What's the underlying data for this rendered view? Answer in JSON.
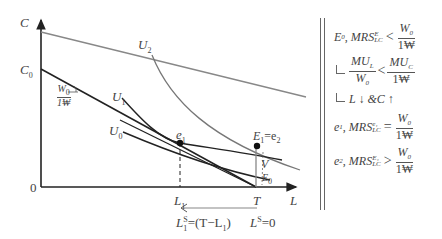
{
  "diagram": {
    "axes": {
      "y_label": "C",
      "x_label": "L",
      "origin_label": "0",
      "y_intercept_label": "C",
      "y_intercept_sub": "0",
      "x_ticks": [
        {
          "label": "L",
          "sub": "1"
        },
        {
          "label": "T",
          "sub": ""
        }
      ]
    },
    "curves": [
      {
        "name": "U0",
        "label": "U",
        "sub": "0",
        "type": "indifference"
      },
      {
        "name": "U1",
        "label": "U",
        "sub": "1",
        "type": "indifference"
      },
      {
        "name": "U2",
        "label": "U",
        "sub": "2",
        "type": "indifference"
      }
    ],
    "lines": [
      {
        "name": "budget-line",
        "from": "C0",
        "to": "T",
        "slope_label_num": "W",
        "slope_label_num_sub": "0",
        "slope_label_den": "1₩"
      },
      {
        "name": "shifted-budget-line",
        "color": "#888888"
      }
    ],
    "points": [
      {
        "name": "e1",
        "label": "e",
        "sub": "1"
      },
      {
        "name": "E1",
        "label": "E",
        "sub": "1",
        "suffix": "=e",
        "suffix_sub": "2"
      },
      {
        "name": "E0",
        "label": "E",
        "sub": "0"
      }
    ],
    "segment_label": "V",
    "labor_supply": {
      "l1_label": "L",
      "l1_sub": "1",
      "l1_sup": "S",
      "l1_expr": "=(T−L",
      "l1_expr_sub": "1",
      "l1_expr_close": ")",
      "l0_label": "L",
      "l0_sup": "S",
      "l0_expr": "=0"
    }
  },
  "notes": [
    {
      "point": "E",
      "point_sub": "0",
      "text": "MRS",
      "sub": "LC",
      "sup": "E",
      "op": "<",
      "rhs_num": "W",
      "rhs_num_sub": "0",
      "rhs_den": "1₩"
    },
    {
      "lhs_num": "MU",
      "lhs_num_sub": "L",
      "lhs_den": "W",
      "lhs_den_sub": "0",
      "op": "<",
      "rhs_num": "MU",
      "rhs_num_sub": "C",
      "rhs_den": "1₩"
    },
    {
      "text": "L ↓ &C ↑"
    },
    {
      "point": "e",
      "point_sub": "1",
      "text": "MRS",
      "sub": "LC",
      "sup": "e₁",
      "op": "=",
      "rhs_num": "W",
      "rhs_num_sub": "0",
      "rhs_den": "1₩"
    },
    {
      "point": "e",
      "point_sub": "2",
      "text": "MRS",
      "sub": "LC",
      "sup": "E₁",
      "op": ">",
      "rhs_num": "W",
      "rhs_num_sub": "0",
      "rhs_den": "1₩"
    }
  ],
  "colors": {
    "axis": "#222222",
    "budget": "#222222",
    "shifted_budget": "#888888",
    "indifference_dark": "#222222",
    "indifference_gray": "#777777",
    "text": "#444444"
  }
}
